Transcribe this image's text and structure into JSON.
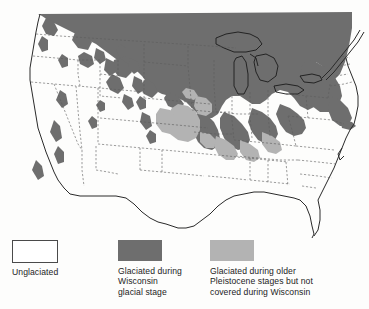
{
  "figure": {
    "kind": "map",
    "background_color": "#fdfdfc"
  },
  "map": {
    "name": "north-america-glaciation-map",
    "colors": {
      "unglaciated_fill": "#ffffff",
      "wisconsin_fill": "#6e6e6e",
      "older_pleistocene_fill": "#b3b3b3",
      "coastline_stroke": "#2a2a2a",
      "state_border_stroke": "#5a5a5a",
      "lake_stroke": "#1f1f1f"
    },
    "regions": [
      {
        "id": "wisconsin-ice-sheet",
        "label": "Glaciated during Wisconsin glacial stage",
        "shade": "dark-gray"
      },
      {
        "id": "older-pleistocene-drift",
        "label": "Glaciated during older Pleistocene stages but not covered during Wisconsin",
        "shade": "light-gray"
      },
      {
        "id": "unglaciated-area",
        "label": "Unglaciated",
        "shade": "white"
      }
    ]
  },
  "legend": {
    "name": "map-legend",
    "entries": [
      {
        "swatch": "white-outlined-box",
        "color": "#ffffff",
        "label": "Unglaciated"
      },
      {
        "swatch": "dark-gray-box",
        "color": "#6e6e6e",
        "label": "Glaciated during\nWisconsin\nglacial stage"
      },
      {
        "swatch": "light-gray-box",
        "color": "#b3b3b3",
        "label": "Glaciated during older\nPleistocene stages but not\ncovered during Wisconsin"
      }
    ]
  }
}
